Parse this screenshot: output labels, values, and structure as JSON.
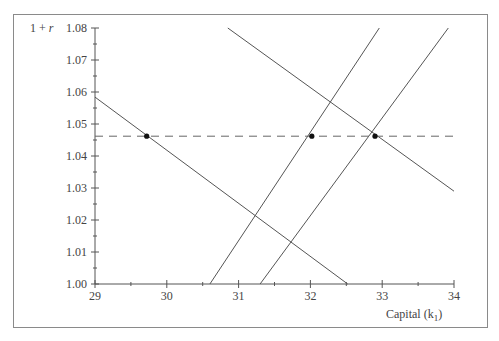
{
  "chart_data": {
    "type": "line",
    "title": "",
    "xlabel": "Capital (k",
    "xlabel_subscript": "1",
    "xlabel_close": ")",
    "ylabel": "1 + r",
    "xlim": [
      29,
      34
    ],
    "ylim": [
      1.0,
      1.08
    ],
    "x_ticks": [
      "29",
      "30",
      "31",
      "32",
      "33",
      "34"
    ],
    "x_tick_values": [
      29,
      30,
      31,
      32,
      33,
      34
    ],
    "x_minor_ticks": [
      29.5,
      30.5,
      31.5,
      32.5,
      33.5
    ],
    "y_ticks": [
      "1.00",
      "1.01",
      "1.02",
      "1.03",
      "1.04",
      "1.05",
      "1.06",
      "1.07",
      "1.08"
    ],
    "y_tick_values": [
      1.0,
      1.01,
      1.02,
      1.03,
      1.04,
      1.05,
      1.06,
      1.07,
      1.08
    ],
    "y_minor_ticks": [
      1.005,
      1.015,
      1.025,
      1.035,
      1.045,
      1.055,
      1.065,
      1.075
    ],
    "grid": false,
    "legend": null,
    "series": [
      {
        "name": "declining-line-left",
        "style": "solid",
        "points": [
          [
            29.0,
            1.0584
          ],
          [
            32.52,
            1.0
          ]
        ]
      },
      {
        "name": "rising-line-middle",
        "style": "solid",
        "points": [
          [
            30.6,
            1.0
          ],
          [
            32.96,
            1.08
          ]
        ]
      },
      {
        "name": "rising-line-right",
        "style": "solid",
        "points": [
          [
            31.3,
            1.0
          ],
          [
            33.92,
            1.08
          ]
        ]
      },
      {
        "name": "declining-line-right",
        "style": "solid",
        "points": [
          [
            30.85,
            1.08
          ],
          [
            34.0,
            1.029
          ]
        ]
      },
      {
        "name": "equilibrium-rate",
        "style": "dashed",
        "points": [
          [
            29.0,
            1.0462
          ],
          [
            34.0,
            1.0462
          ]
        ]
      }
    ],
    "markers": [
      {
        "label": "point-1",
        "x": 29.72,
        "y": 1.0462
      },
      {
        "label": "point-2",
        "x": 32.02,
        "y": 1.0462
      },
      {
        "label": "point-3",
        "x": 32.9,
        "y": 1.0462
      }
    ]
  },
  "style": {
    "line_color": "#555555",
    "dash_color": "#666666",
    "marker_color": "#111111",
    "frame_color": "#8a8a8a"
  }
}
